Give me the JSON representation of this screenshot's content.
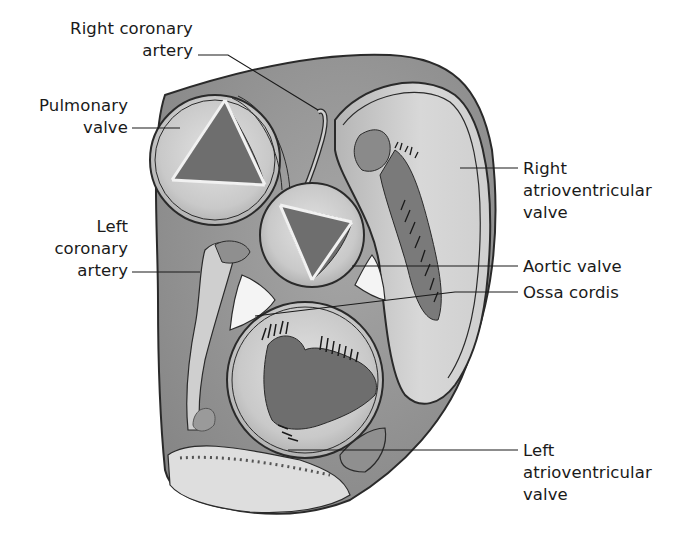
{
  "diagram": {
    "colors": {
      "background": "#ffffff",
      "outer_tissue": "#8f8f8f",
      "light_tissue": "#d0d0d0",
      "dark_cusp": "#6e6e6e",
      "outline": "#2a2a2a",
      "ossa": "#f4f4f4"
    },
    "labels": [
      {
        "id": "right-coronary-artery",
        "text": "Right coronary\nartery",
        "side": "left"
      },
      {
        "id": "pulmonary-valve",
        "text": "Pulmonary\nvalve",
        "side": "left"
      },
      {
        "id": "left-coronary-artery",
        "text": "Left\ncoronary\nartery",
        "side": "left"
      },
      {
        "id": "right-atrioventricular-valve",
        "text": "Right\natrioventricular\nvalve",
        "side": "right"
      },
      {
        "id": "aortic-valve",
        "text": "Aortic valve",
        "side": "right"
      },
      {
        "id": "ossa-cordis",
        "text": "Ossa cordis",
        "side": "right"
      },
      {
        "id": "left-atrioventricular-valve",
        "text": "Left\natrioventricular\nvalve",
        "side": "right"
      }
    ]
  }
}
